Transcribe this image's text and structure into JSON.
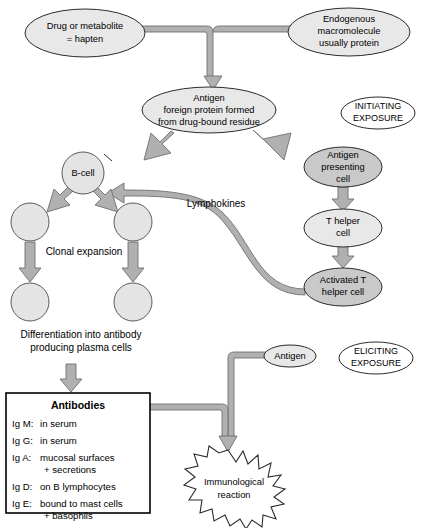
{
  "diagram": {
    "colors": {
      "node_light": "#e8e8e8",
      "node_mid": "#c9c9c9",
      "node_white": "#ffffff",
      "connector_fill": "#b0b0b0",
      "connector_stroke": "#6f6f6f",
      "outline": "#2b2b2b",
      "background": "#ffffff"
    }
  },
  "nodes": {
    "hapten": {
      "line1": "Drug or metabolite",
      "line2": "= hapten"
    },
    "endogenous": {
      "line1": "Endogenous",
      "line2": "macromolecule",
      "line3": "usually protein"
    },
    "antigen_formed": {
      "line1": "Antigen",
      "line2": "foreign protein formed",
      "line3": "from drug-bound residue"
    },
    "initiating_exposure": {
      "line1": "INITIATING",
      "line2": "EXPOSURE"
    },
    "eliciting_exposure": {
      "line1": "ELICITING",
      "line2": "EXPOSURE"
    },
    "b_cell": {
      "label": "B-cell"
    },
    "antigen_presenting_cell": {
      "line1": "Antigen",
      "line2": "presenting",
      "line3": "cell"
    },
    "t_helper_cell": {
      "line1": "T helper",
      "line2": "cell"
    },
    "activated_t_helper_cell": {
      "line1": "Activated T",
      "line2": "helper cell"
    },
    "antigen_elicit": {
      "label": "Antigen"
    },
    "immunological_reaction": {
      "line1": "Immunological",
      "line2": "reaction"
    }
  },
  "labels": {
    "lymphokines": "Lymphokines",
    "clonal_expansion": "Clonal expansion",
    "differentiation_line1": "Differentiation into antibody",
    "differentiation_line2": "producing plasma cells"
  },
  "antibodies_box": {
    "title": "Antibodies",
    "rows": [
      {
        "key": "Ig M:",
        "value": "in serum",
        "value2": ""
      },
      {
        "key": "Ig G:",
        "value": "in serum",
        "value2": ""
      },
      {
        "key": "Ig A:",
        "value": "mucosal surfaces",
        "value2": "+ secretions"
      },
      {
        "key": "Ig D:",
        "value": "on B lymphocytes",
        "value2": ""
      },
      {
        "key": "Ig E:",
        "value": "bound to mast cells",
        "value2": "+ basophils"
      }
    ]
  }
}
